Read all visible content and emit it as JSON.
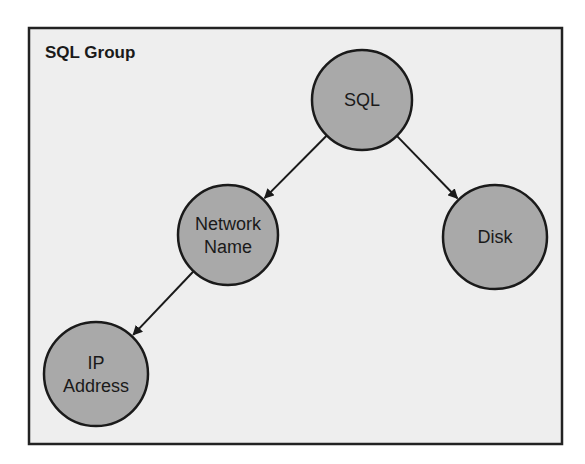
{
  "group": {
    "title": "SQL Group",
    "box": {
      "x": 29,
      "y": 28,
      "width": 533,
      "height": 416
    },
    "fill": "#eeeeee",
    "stroke": "#222222"
  },
  "nodes": [
    {
      "id": "sql",
      "lines": [
        "SQL"
      ],
      "cx": 362,
      "cy": 100,
      "r": 50
    },
    {
      "id": "network-name",
      "lines": [
        "Network",
        "Name"
      ],
      "cx": 228,
      "cy": 235,
      "r": 50
    },
    {
      "id": "disk",
      "lines": [
        "Disk"
      ],
      "cx": 495,
      "cy": 237,
      "r": 52
    },
    {
      "id": "ip-address",
      "lines": [
        "IP",
        "Address"
      ],
      "cx": 96,
      "cy": 374,
      "r": 52
    }
  ],
  "node_fill": "#a9a9a9",
  "node_stroke": "#1a1a1a",
  "edges": [
    {
      "from": "sql",
      "to": "network-name"
    },
    {
      "from": "sql",
      "to": "disk"
    },
    {
      "from": "network-name",
      "to": "ip-address"
    }
  ]
}
